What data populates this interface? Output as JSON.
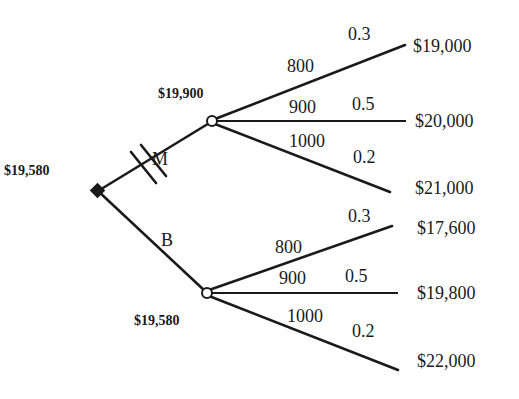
{
  "diagram": {
    "type": "decision-tree",
    "root": {
      "node_type": "decision",
      "value": "$19,580",
      "branches": [
        {
          "label": "M",
          "blocked": true,
          "chance_node": {
            "value": "$19,900",
            "outcomes": [
              {
                "amount": "800",
                "probability": "0.3",
                "payoff": "$19,000"
              },
              {
                "amount": "900",
                "probability": "0.5",
                "payoff": "$20,000"
              },
              {
                "amount": "1000",
                "probability": "0.2",
                "payoff": "$21,000"
              }
            ]
          }
        },
        {
          "label": "B",
          "blocked": false,
          "chance_node": {
            "value": "$19,580",
            "outcomes": [
              {
                "amount": "800",
                "probability": "0.3",
                "payoff": "$17,600"
              },
              {
                "amount": "900",
                "probability": "0.5",
                "payoff": "$19,800"
              },
              {
                "amount": "1000",
                "probability": "0.2",
                "payoff": "$22,000"
              }
            ]
          }
        }
      ]
    }
  }
}
